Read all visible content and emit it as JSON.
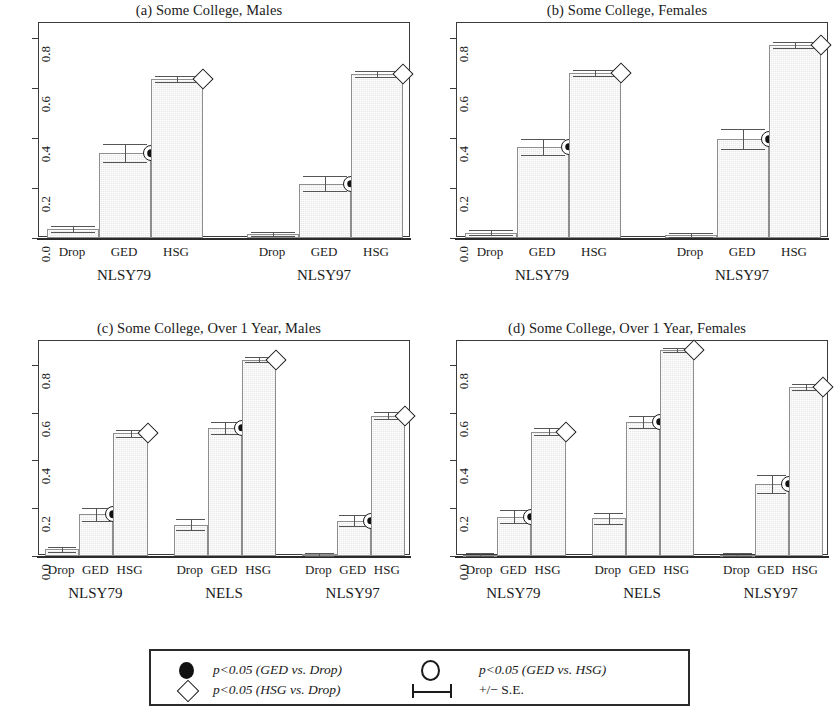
{
  "figure": {
    "width": 837,
    "height": 717,
    "background": "#ffffff",
    "bar_fill": "#e9e9e9",
    "bar_edge": "#8e8e8e",
    "axis_color": "#2b2b2b"
  },
  "chart_data": [
    {
      "id": "a",
      "type": "bar",
      "title": "(a) Some College, Males",
      "xlabel": "",
      "ylabel": "",
      "ylim": [
        0,
        0.86
      ],
      "yticks": [
        0.0,
        0.2,
        0.4,
        0.6,
        0.8
      ],
      "ytick_labels": [
        "0.0",
        "0.2",
        "0.4",
        "0.6",
        "0.8"
      ],
      "grid": false,
      "legend_position": "below-figure",
      "categories": [
        "Drop",
        "GED",
        "HSG"
      ],
      "groups": [
        {
          "name": "NLSY79",
          "values": [
            0.035,
            0.34,
            0.635
          ],
          "se": [
            0.012,
            0.035,
            0.012
          ],
          "markers": [
            null,
            "filled-circle",
            "open-diamond"
          ]
        },
        {
          "name": "NLSY97",
          "values": [
            0.016,
            0.218,
            0.657
          ],
          "se": [
            0.009,
            0.031,
            0.012
          ],
          "markers": [
            null,
            "filled-circle",
            "open-diamond"
          ]
        }
      ]
    },
    {
      "id": "b",
      "type": "bar",
      "title": "(b) Some College, Females",
      "xlabel": "",
      "ylabel": "",
      "ylim": [
        0,
        0.86
      ],
      "yticks": [
        0.0,
        0.2,
        0.4,
        0.6,
        0.8
      ],
      "ytick_labels": [
        "0.0",
        "0.2",
        "0.4",
        "0.6",
        "0.8"
      ],
      "grid": false,
      "legend_position": "below-figure",
      "categories": [
        "Drop",
        "GED",
        "HSG"
      ],
      "groups": [
        {
          "name": "NLSY79",
          "values": [
            0.022,
            0.365,
            0.662
          ],
          "se": [
            0.01,
            0.032,
            0.012
          ],
          "markers": [
            null,
            "filled-circle",
            "open-diamond"
          ]
        },
        {
          "name": "NLSY97",
          "values": [
            0.012,
            0.395,
            0.772
          ],
          "se": [
            0.008,
            0.04,
            0.012
          ],
          "markers": [
            null,
            "filled-circle",
            "open-diamond"
          ]
        }
      ]
    },
    {
      "id": "c",
      "type": "bar",
      "title": "(c) Some College, Over 1 Year, Males",
      "xlabel": "",
      "ylabel": "",
      "ylim": [
        0,
        0.9
      ],
      "yticks": [
        0.0,
        0.2,
        0.4,
        0.6,
        0.8
      ],
      "ytick_labels": [
        "0.0",
        "0.2",
        "0.4",
        "0.6",
        "0.8"
      ],
      "grid": false,
      "legend_position": "below-figure",
      "categories": [
        "Drop",
        "GED",
        "HSG"
      ],
      "groups": [
        {
          "name": "NLSY79",
          "values": [
            0.028,
            0.175,
            0.513
          ],
          "se": [
            0.011,
            0.028,
            0.014
          ],
          "markers": [
            null,
            "filled-circle",
            "open-diamond"
          ]
        },
        {
          "name": "NELS",
          "values": [
            0.131,
            0.537,
            0.822
          ],
          "se": [
            0.023,
            0.026,
            0.01
          ],
          "markers": [
            null,
            "filled-circle",
            "open-diamond"
          ]
        },
        {
          "name": "NLSY97",
          "values": [
            0.008,
            0.148,
            0.588
          ],
          "se": [
            0.006,
            0.023,
            0.013
          ],
          "markers": [
            null,
            "filled-circle",
            "open-diamond"
          ]
        }
      ]
    },
    {
      "id": "d",
      "type": "bar",
      "title": "(d) Some College, Over 1 Year, Females",
      "xlabel": "",
      "ylabel": "",
      "ylim": [
        0,
        0.9
      ],
      "yticks": [
        0.0,
        0.2,
        0.4,
        0.6,
        0.8
      ],
      "ytick_labels": [
        "0.0",
        "0.2",
        "0.4",
        "0.6",
        "0.8"
      ],
      "grid": false,
      "legend_position": "below-figure",
      "categories": [
        "Drop",
        "GED",
        "HSG"
      ],
      "groups": [
        {
          "name": "NLSY79",
          "values": [
            0.006,
            0.165,
            0.521
          ],
          "se": [
            0.005,
            0.027,
            0.014
          ],
          "markers": [
            null,
            "filled-circle",
            "open-diamond"
          ]
        },
        {
          "name": "NELS",
          "values": [
            0.158,
            0.562,
            0.862
          ],
          "se": [
            0.022,
            0.026,
            0.009
          ],
          "markers": [
            null,
            "filled-circle",
            "open-diamond"
          ]
        },
        {
          "name": "NLSY97",
          "values": [
            0.006,
            0.303,
            0.708
          ],
          "se": [
            0.005,
            0.038,
            0.012
          ],
          "markers": [
            null,
            "filled-circle",
            "open-diamond"
          ]
        }
      ]
    }
  ],
  "legend": {
    "entries": [
      {
        "symbol": "filled-circle",
        "label": "p<0.05 (GED vs. Drop)"
      },
      {
        "symbol": "open-circle",
        "label": "p<0.05 (GED vs. HSG)"
      },
      {
        "symbol": "open-diamond",
        "label": "p<0.05 (HSG vs. Drop)"
      },
      {
        "symbol": "error-bar",
        "label": "+/− S.E."
      }
    ]
  }
}
